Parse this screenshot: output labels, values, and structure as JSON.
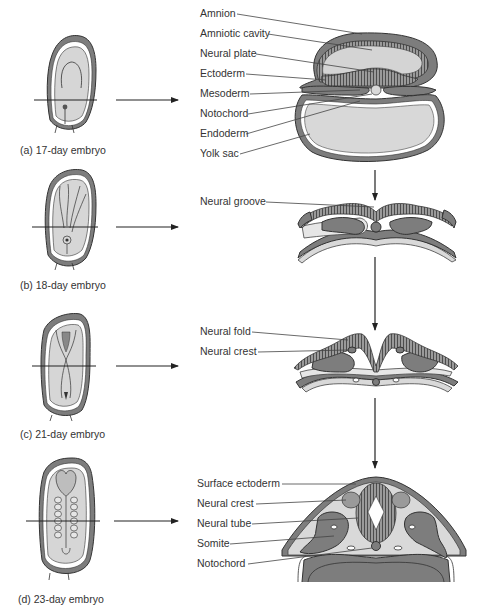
{
  "figure": {
    "panels": [
      {
        "id": "a",
        "caption": "(a) 17-day embryo",
        "labels": [
          "Amnion",
          "Amniotic cavity",
          "Neural plate",
          "Ectoderm",
          "Mesoderm",
          "Notochord",
          "Endoderm",
          "Yolk sac"
        ]
      },
      {
        "id": "b",
        "caption": "(b) 18-day embryo",
        "labels": [
          "Neural groove"
        ]
      },
      {
        "id": "c",
        "caption": "(c) 21-day embryo",
        "labels": [
          "Neural fold",
          "Neural crest"
        ]
      },
      {
        "id": "d",
        "caption": "(d) 23-day embryo",
        "labels": [
          "Surface ectoderm",
          "Neural crest",
          "Neural tube",
          "Somite",
          "Notochord"
        ]
      }
    ],
    "colors": {
      "tissue_dark": "#7d7d7d",
      "tissue_light": "#d9d9d9",
      "outline": "#333333"
    }
  }
}
